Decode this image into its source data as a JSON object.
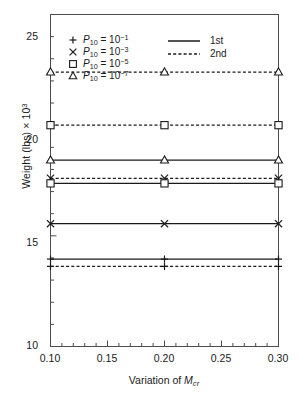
{
  "chart_data": {
    "type": "line",
    "title": "",
    "xlabel": "Variation of Mcr",
    "xlabel_parts": {
      "prefix": "Variation of ",
      "symbol": "M",
      "subscript": "cr"
    },
    "ylabel": "Weight (lbs) x 10^3",
    "ylabel_parts": {
      "prefix": "Weight (lbs) ",
      "times": "×",
      "base": " 10",
      "exponent": "3"
    },
    "x": [
      0.1,
      0.2,
      0.3
    ],
    "xlim": [
      0.1,
      0.3
    ],
    "ylim": [
      10,
      25
    ],
    "xticks": [
      0.1,
      0.15,
      0.2,
      0.25,
      0.3
    ],
    "xtick_labels": [
      "0.10",
      "0.15",
      "0.20",
      "0.25",
      "0.30"
    ],
    "yticks": [
      10,
      15,
      20,
      25
    ],
    "ytick_labels": [
      "10",
      "15",
      "20",
      "25"
    ],
    "minor_ticks": true,
    "grid": false,
    "legend_position": "upper-left-inside",
    "series": [
      {
        "name": "P10 = 10^-1, 1st",
        "marker": "plus",
        "line": "solid",
        "values": [
          13.95,
          13.95,
          13.95
        ]
      },
      {
        "name": "P10 = 10^-1, 2nd",
        "marker": "plus",
        "line": "dashed",
        "values": [
          13.62,
          13.62,
          13.62
        ]
      },
      {
        "name": "P10 = 10^-3, 1st",
        "marker": "cross",
        "line": "solid",
        "values": [
          15.55,
          15.55,
          15.55
        ]
      },
      {
        "name": "P10 = 10^-3, 2nd",
        "marker": "cross",
        "line": "dashed",
        "values": [
          17.6,
          17.6,
          17.6
        ]
      },
      {
        "name": "P10 = 10^-5, 1st",
        "marker": "square",
        "line": "solid",
        "values": [
          17.37,
          17.37,
          17.37
        ]
      },
      {
        "name": "P10 = 10^-5, 2nd",
        "marker": "square",
        "line": "dashed",
        "values": [
          20.0,
          20.0,
          20.0
        ]
      },
      {
        "name": "P10 = 10^-7, 1st",
        "marker": "triangle",
        "line": "solid",
        "values": [
          18.42,
          18.42,
          18.42
        ]
      },
      {
        "name": "P10 = 10^-7, 2nd",
        "marker": "triangle",
        "line": "dashed",
        "values": [
          22.4,
          22.4,
          22.4
        ]
      }
    ],
    "legend_markers": [
      {
        "marker": "plus",
        "symbol": "P",
        "subscript": "10",
        "equals": " = 10",
        "exponent": "−1"
      },
      {
        "marker": "cross",
        "symbol": "P",
        "subscript": "10",
        "equals": " = 10",
        "exponent": "−3"
      },
      {
        "marker": "square",
        "symbol": "P",
        "subscript": "10",
        "equals": " = 10",
        "exponent": "−5"
      },
      {
        "marker": "triangle",
        "symbol": "P",
        "subscript": "10",
        "equals": " = 10",
        "exponent": "−7"
      }
    ],
    "legend_lines": [
      {
        "style": "solid",
        "label": "1st"
      },
      {
        "style": "dashed",
        "label": "2nd"
      }
    ],
    "colors": {
      "line": "#1a1a1a",
      "axis": "#4d4d4d",
      "background": "#ffffff"
    }
  }
}
